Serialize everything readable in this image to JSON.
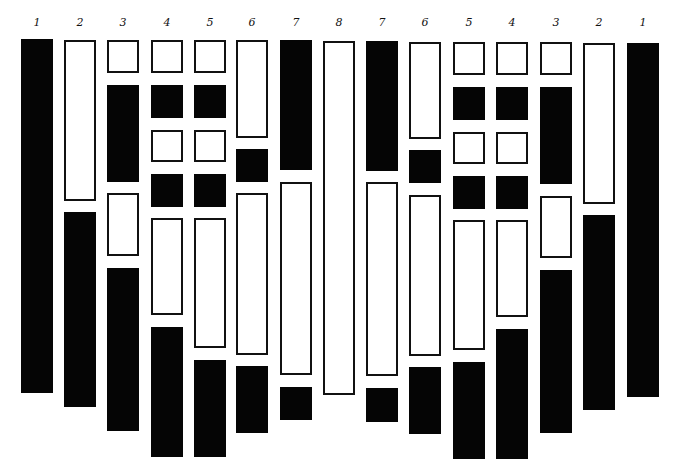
{
  "diagram": {
    "type": "symmetric banded bar diagram",
    "background": "#ffffff",
    "colors": {
      "filled": "#050505",
      "outline": "#111111"
    },
    "columns": [
      {
        "label": "1",
        "x": 21,
        "segments": [
          {
            "fill": "black",
            "top": 39,
            "bottom": 393
          }
        ]
      },
      {
        "label": "2",
        "x": 64,
        "segments": [
          {
            "fill": "white",
            "top": 40,
            "bottom": 201
          },
          {
            "fill": "black",
            "top": 212,
            "bottom": 407
          }
        ]
      },
      {
        "label": "3",
        "x": 107,
        "segments": [
          {
            "fill": "white",
            "top": 40,
            "bottom": 73
          },
          {
            "fill": "black",
            "top": 85,
            "bottom": 182
          },
          {
            "fill": "white",
            "top": 193,
            "bottom": 256
          },
          {
            "fill": "black",
            "top": 268,
            "bottom": 431
          }
        ]
      },
      {
        "label": "4",
        "x": 151,
        "segments": [
          {
            "fill": "white",
            "top": 40,
            "bottom": 73
          },
          {
            "fill": "black",
            "top": 85,
            "bottom": 118
          },
          {
            "fill": "white",
            "top": 130,
            "bottom": 162
          },
          {
            "fill": "black",
            "top": 174,
            "bottom": 207
          },
          {
            "fill": "white",
            "top": 218,
            "bottom": 315
          },
          {
            "fill": "black",
            "top": 327,
            "bottom": 457
          }
        ]
      },
      {
        "label": "5",
        "x": 194,
        "segments": [
          {
            "fill": "white",
            "top": 40,
            "bottom": 73
          },
          {
            "fill": "black",
            "top": 85,
            "bottom": 118
          },
          {
            "fill": "white",
            "top": 130,
            "bottom": 162
          },
          {
            "fill": "black",
            "top": 174,
            "bottom": 207
          },
          {
            "fill": "white",
            "top": 218,
            "bottom": 348
          },
          {
            "fill": "black",
            "top": 360,
            "bottom": 457
          }
        ]
      },
      {
        "label": "6",
        "x": 236,
        "segments": [
          {
            "fill": "white",
            "top": 40,
            "bottom": 138
          },
          {
            "fill": "black",
            "top": 149,
            "bottom": 182
          },
          {
            "fill": "white",
            "top": 193,
            "bottom": 355
          },
          {
            "fill": "black",
            "top": 366,
            "bottom": 433
          }
        ]
      },
      {
        "label": "7",
        "x": 280,
        "segments": [
          {
            "fill": "black",
            "top": 40,
            "bottom": 170
          },
          {
            "fill": "white",
            "top": 182,
            "bottom": 375
          },
          {
            "fill": "black",
            "top": 387,
            "bottom": 420
          }
        ]
      },
      {
        "label": "8",
        "x": 323,
        "segments": [
          {
            "fill": "white",
            "top": 41,
            "bottom": 395
          }
        ]
      },
      {
        "label": "7",
        "x": 366,
        "segments": [
          {
            "fill": "black",
            "top": 41,
            "bottom": 171
          },
          {
            "fill": "white",
            "top": 182,
            "bottom": 376
          },
          {
            "fill": "black",
            "top": 388,
            "bottom": 422
          }
        ]
      },
      {
        "label": "6",
        "x": 409,
        "segments": [
          {
            "fill": "white",
            "top": 42,
            "bottom": 139
          },
          {
            "fill": "black",
            "top": 150,
            "bottom": 183
          },
          {
            "fill": "white",
            "top": 195,
            "bottom": 356
          },
          {
            "fill": "black",
            "top": 367,
            "bottom": 434
          }
        ]
      },
      {
        "label": "5",
        "x": 453,
        "segments": [
          {
            "fill": "white",
            "top": 42,
            "bottom": 75
          },
          {
            "fill": "black",
            "top": 87,
            "bottom": 120
          },
          {
            "fill": "white",
            "top": 132,
            "bottom": 164
          },
          {
            "fill": "black",
            "top": 176,
            "bottom": 209
          },
          {
            "fill": "white",
            "top": 220,
            "bottom": 350
          },
          {
            "fill": "black",
            "top": 362,
            "bottom": 459
          }
        ]
      },
      {
        "label": "4",
        "x": 496,
        "segments": [
          {
            "fill": "white",
            "top": 42,
            "bottom": 75
          },
          {
            "fill": "black",
            "top": 87,
            "bottom": 120
          },
          {
            "fill": "white",
            "top": 132,
            "bottom": 164
          },
          {
            "fill": "black",
            "top": 176,
            "bottom": 209
          },
          {
            "fill": "white",
            "top": 220,
            "bottom": 317
          },
          {
            "fill": "black",
            "top": 329,
            "bottom": 459
          }
        ]
      },
      {
        "label": "3",
        "x": 540,
        "segments": [
          {
            "fill": "white",
            "top": 42,
            "bottom": 75
          },
          {
            "fill": "black",
            "top": 87,
            "bottom": 184
          },
          {
            "fill": "white",
            "top": 196,
            "bottom": 258
          },
          {
            "fill": "black",
            "top": 270,
            "bottom": 433
          }
        ]
      },
      {
        "label": "2",
        "x": 583,
        "segments": [
          {
            "fill": "white",
            "top": 43,
            "bottom": 204
          },
          {
            "fill": "black",
            "top": 215,
            "bottom": 410
          }
        ]
      },
      {
        "label": "1",
        "x": 627,
        "segments": [
          {
            "fill": "black",
            "top": 43,
            "bottom": 397
          }
        ]
      }
    ]
  }
}
